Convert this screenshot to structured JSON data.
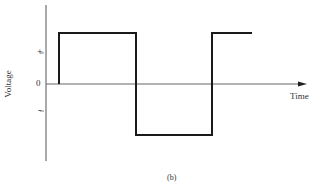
{
  "figure": {
    "caption": "(b)",
    "y_axis_label": "Voltage",
    "x_axis_label": "Time",
    "tick_labels": {
      "plus": "+",
      "zero": "0",
      "minus": "-"
    }
  },
  "colors": {
    "axis": "#555555",
    "waveform": "#1a1a1a",
    "background": "#ffffff"
  },
  "waveform": {
    "type": "square-wave",
    "levels": [
      "0",
      "+",
      "-",
      "+"
    ],
    "segments": [
      {
        "from": "t0",
        "level": "0 -> +"
      },
      {
        "from": "t1",
        "level": "+ -> -"
      },
      {
        "from": "t2",
        "level": "- -> +"
      }
    ]
  }
}
